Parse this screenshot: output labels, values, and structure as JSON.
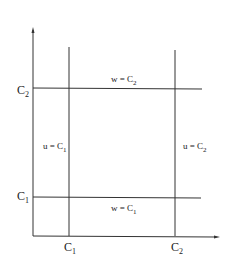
{
  "diagram": {
    "axes": {
      "x_ticks": [
        {
          "label": "C",
          "sub": "1"
        },
        {
          "label": "C",
          "sub": "2"
        }
      ],
      "y_ticks": [
        {
          "label": "C",
          "sub": "1"
        },
        {
          "label": "C",
          "sub": "2"
        }
      ]
    },
    "line_labels": {
      "w_top": {
        "text": "w = C",
        "sub": "2"
      },
      "w_bottom": {
        "text": "w = C",
        "sub": "1"
      },
      "u_left": {
        "text": "u = C",
        "sub": "1"
      },
      "u_right": {
        "text": "u = C",
        "sub": "2"
      }
    },
    "colors": {
      "line": "#333333",
      "background": "#ffffff"
    }
  }
}
